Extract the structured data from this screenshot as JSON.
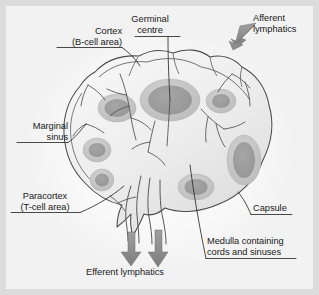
{
  "figure": {
    "background_color": "#f2f2f2",
    "frame_color": "#dcdcdc",
    "ink_color": "#3a3a3a",
    "arrow_color": "#8e8e8e",
    "node_fill": "#ececec",
    "follicle_fill": "#c6c6c6",
    "germinal_fill": "#9c9c9c"
  },
  "labels": {
    "cortex": {
      "line1": "Cortex",
      "line2": "(B-cell area)"
    },
    "germinal_centre": {
      "line1": "Germinal",
      "line2": "centre"
    },
    "afferent": {
      "line1": "Afferent",
      "line2": "lymphatics"
    },
    "marginal_sinus": {
      "line1": "Marginal",
      "line2": "sinus"
    },
    "paracortex": {
      "line1": "Paracortex",
      "line2": "(T-cell area)"
    },
    "capsule": {
      "line1": "Capsule"
    },
    "medulla": {
      "line1": "Medulla containing",
      "line2": "cords and sinuses"
    },
    "efferent": {
      "line1": "Efferent lymphatics"
    }
  },
  "structures": [
    {
      "name": "capsule",
      "description": "outer bean-shaped boundary of the node"
    },
    {
      "name": "cortex",
      "description": "outer region containing B-cell follicles"
    },
    {
      "name": "germinal-centre",
      "description": "dark core of a secondary follicle"
    },
    {
      "name": "marginal-sinus",
      "description": "space beneath the capsule"
    },
    {
      "name": "paracortex",
      "description": "deep T-cell zone"
    },
    {
      "name": "medulla",
      "description": "inner region with cords and sinuses"
    },
    {
      "name": "afferent-lymphatics",
      "description": "vessels entering the node"
    },
    {
      "name": "efferent-lymphatics",
      "description": "vessels leaving at the hilum"
    }
  ]
}
